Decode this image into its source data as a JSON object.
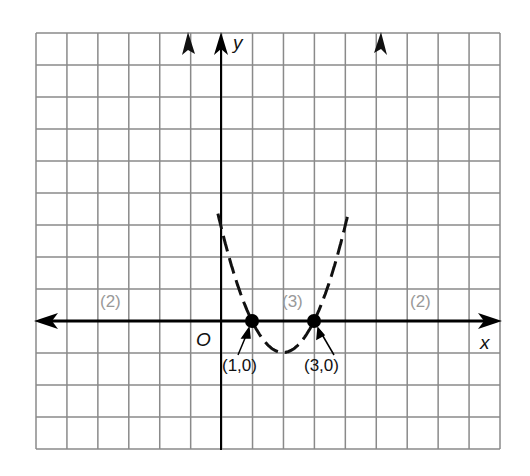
{
  "chart_data": {
    "type": "line",
    "title": "",
    "xlabel": "x",
    "ylabel": "y",
    "origin_label": "O",
    "grid": true,
    "xlim": [
      -6,
      9
    ],
    "ylim": [
      -4,
      9
    ],
    "function": "y = (x-1)(x-3)",
    "line_style": "dashed",
    "points": [
      {
        "x": 1,
        "y": 0,
        "label": "(1,0)"
      },
      {
        "x": 3,
        "y": 0,
        "label": "(3,0)"
      }
    ],
    "series": [
      {
        "name": "parabola",
        "x": [
          -0.1,
          0,
          1,
          2,
          3,
          4,
          4.9
        ],
        "y": [
          9.3,
          3,
          0,
          -1,
          0,
          3,
          9.3
        ]
      }
    ],
    "annotations": [
      {
        "text": "(2)",
        "region": "left of x=1"
      },
      {
        "text": "(3)",
        "region": "between x=1 and x=3"
      },
      {
        "text": "(2)",
        "region": "right of x=3"
      }
    ]
  },
  "labels": {
    "x_axis": "x",
    "y_axis": "y",
    "origin": "O",
    "point1": "(1,0)",
    "point2": "(3,0)",
    "region_left": "(2)",
    "region_mid": "(3)",
    "region_right": "(2)"
  }
}
